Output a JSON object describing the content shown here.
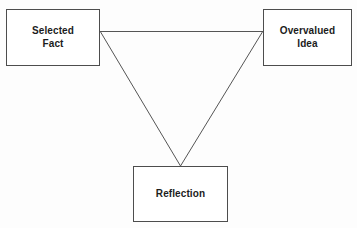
{
  "diagram": {
    "background_color": "#fdfdfd",
    "line_color": "#555555",
    "box_border_color": "#4d4d4d",
    "box_fill_color": "#ffffff",
    "text_color": "#1c1c1c",
    "nodes": [
      {
        "id": "selected-fact",
        "label": "Selected\nFact"
      },
      {
        "id": "overvalued-idea",
        "label": "Overvalued\nIdea"
      },
      {
        "id": "reflection",
        "label": "Reflection"
      }
    ],
    "edges": [
      {
        "id": "edge-selected-fact-to-overvalued-idea",
        "from": "selected-fact",
        "to": "overvalued-idea"
      },
      {
        "id": "edge-selected-fact-to-reflection",
        "from": "selected-fact",
        "to": "reflection"
      },
      {
        "id": "edge-overvalued-idea-to-reflection",
        "from": "overvalued-idea",
        "to": "reflection"
      }
    ]
  }
}
